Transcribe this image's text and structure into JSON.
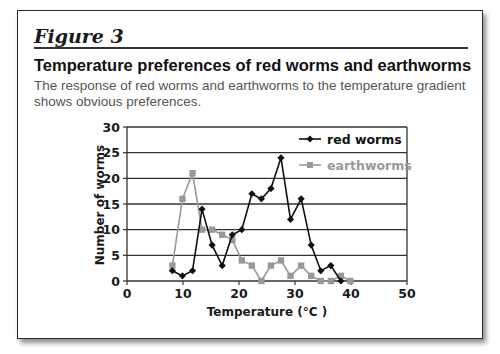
{
  "figure": {
    "label": "Figure 3",
    "heading": "Temperature preferences of red worms and earthworms",
    "subtitle": "The response of red worms and earthworms to the temperature gradient shows obvious preferences."
  },
  "colors": {
    "red_worms": "#111111",
    "earthworms": "#999999",
    "grid": "#333333"
  },
  "chart_data": {
    "type": "line",
    "title": "Temperature preferences of red worms and earthworms",
    "xlabel": "Temperature (°C )",
    "ylabel": "Number of worms",
    "xlim": [
      0,
      50
    ],
    "ylim": [
      0,
      30
    ],
    "xticks": [
      0,
      10,
      20,
      30,
      40,
      50
    ],
    "yticks": [
      0,
      5,
      10,
      15,
      20,
      25,
      30
    ],
    "grid": "horizontal",
    "legend_position": "upper right (inside plot)",
    "series": [
      {
        "name": "red worms",
        "marker": "diamond",
        "color": "#111111",
        "x": [
          8.1,
          9.9,
          11.7,
          13.4,
          15.2,
          17.0,
          18.8,
          20.5,
          22.3,
          24.0,
          25.7,
          27.5,
          29.2,
          31.1,
          32.9,
          34.6,
          36.4,
          38.2
        ],
        "y": [
          2,
          1,
          2,
          14,
          7,
          3,
          9,
          10,
          17,
          16,
          18,
          24,
          12,
          16,
          7,
          2,
          3,
          0
        ]
      },
      {
        "name": "earthworms",
        "marker": "square",
        "color": "#999999",
        "x": [
          8.1,
          9.9,
          11.7,
          13.4,
          15.2,
          17.0,
          18.8,
          20.5,
          22.3,
          24.0,
          25.7,
          27.5,
          29.2,
          31.1,
          32.9,
          34.6,
          36.4,
          38.2,
          39.9
        ],
        "y": [
          3,
          16,
          21,
          10,
          10,
          9,
          8,
          4,
          3,
          0,
          3,
          4,
          1,
          3,
          1,
          0,
          0,
          1,
          0
        ]
      }
    ]
  }
}
